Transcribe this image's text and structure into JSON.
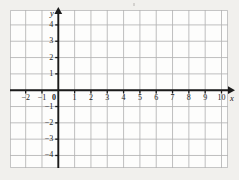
{
  "figure": {
    "kind": "cartesian-coordinate-grid",
    "background_color": "#f1f0ed",
    "plate_color": "#fdfdfc",
    "grid_color": "#b4b4b4",
    "axis_color": "#1b1b1b",
    "label_color": "#1c1c1c",
    "artifact_mark": ""
  },
  "chart_data": {
    "type": "scatter",
    "title": "",
    "subtitle": "",
    "xlabel": "x",
    "ylabel": "y",
    "xlim": [
      -2.95,
      10.85
    ],
    "ylim": [
      -4.85,
      4.85
    ],
    "xticks": [
      -2,
      -1,
      0,
      1,
      2,
      3,
      4,
      5,
      6,
      7,
      8,
      9,
      10
    ],
    "yticks": [
      4,
      3,
      2,
      1,
      -1,
      -2,
      -3,
      -4
    ],
    "xtick_labels": [
      "−2",
      "−1",
      "0",
      "1",
      "2",
      "3",
      "4",
      "5",
      "6",
      "7",
      "8",
      "9",
      "10"
    ],
    "ytick_labels": [
      "4",
      "3",
      "2",
      "1",
      "−1",
      "−2",
      "−3",
      "−4"
    ],
    "grid": true,
    "grid_step": 1,
    "legend": false,
    "legend_position": "none",
    "series": [
      {
        "name": "",
        "x": [],
        "y": []
      }
    ],
    "annotations": [],
    "axis_arrows": {
      "x_positive": true,
      "y_positive": true
    },
    "origin_label": "0"
  },
  "axis_names": {
    "x": "x",
    "y": "y"
  }
}
